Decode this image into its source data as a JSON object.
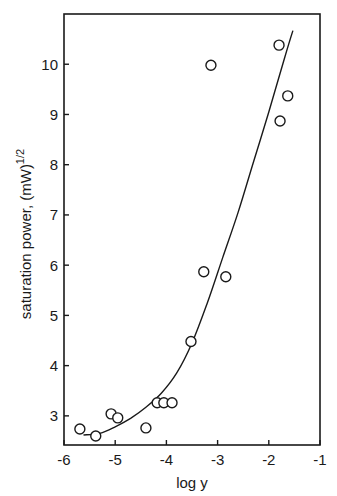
{
  "chart_data": {
    "type": "scatter",
    "title": "",
    "xlabel": "log y",
    "ylabel": "saturation power, (mW)^1/2",
    "ylabel_main": "saturation power, (mW)",
    "ylabel_exponent": "1/2",
    "xlim": [
      -6,
      -1
    ],
    "ylim": [
      2.42,
      11.0
    ],
    "xticks": [
      "-6",
      "-5",
      "-4",
      "-3",
      "-2",
      "-1"
    ],
    "yticks": [
      "3",
      "4",
      "5",
      "6",
      "7",
      "8",
      "9",
      "10"
    ],
    "grid": false,
    "legend": null,
    "series": [
      {
        "name": "measured",
        "marker": "open-circle",
        "points": [
          {
            "x": -5.69,
            "y": 2.74
          },
          {
            "x": -5.38,
            "y": 2.6
          },
          {
            "x": -5.08,
            "y": 3.04
          },
          {
            "x": -4.95,
            "y": 2.96
          },
          {
            "x": -4.4,
            "y": 2.76
          },
          {
            "x": -4.18,
            "y": 3.26
          },
          {
            "x": -4.05,
            "y": 3.26
          },
          {
            "x": -3.89,
            "y": 3.26
          },
          {
            "x": -3.52,
            "y": 4.48
          },
          {
            "x": -3.27,
            "y": 5.87
          },
          {
            "x": -3.13,
            "y": 9.98
          },
          {
            "x": -2.84,
            "y": 5.77
          },
          {
            "x": -1.8,
            "y": 10.38
          },
          {
            "x": -1.78,
            "y": 8.87
          },
          {
            "x": -1.63,
            "y": 9.37
          }
        ]
      },
      {
        "name": "fit curve",
        "marker": "line",
        "points": [
          {
            "x": -5.62,
            "y": 2.62
          },
          {
            "x": -5.3,
            "y": 2.65
          },
          {
            "x": -5.0,
            "y": 2.78
          },
          {
            "x": -4.7,
            "y": 2.95
          },
          {
            "x": -4.4,
            "y": 3.17
          },
          {
            "x": -4.1,
            "y": 3.45
          },
          {
            "x": -3.8,
            "y": 3.85
          },
          {
            "x": -3.5,
            "y": 4.45
          },
          {
            "x": -3.2,
            "y": 5.25
          },
          {
            "x": -2.9,
            "y": 6.15
          },
          {
            "x": -2.6,
            "y": 7.05
          },
          {
            "x": -2.3,
            "y": 8.05
          },
          {
            "x": -2.0,
            "y": 9.05
          },
          {
            "x": -1.7,
            "y": 10.1
          },
          {
            "x": -1.53,
            "y": 10.67
          }
        ]
      }
    ]
  },
  "plot": {
    "frame": {
      "left": 64,
      "right": 320,
      "top": 14,
      "bottom": 445
    },
    "colors": {
      "ink": "#1a1a1a",
      "background": "#ffffff"
    }
  }
}
